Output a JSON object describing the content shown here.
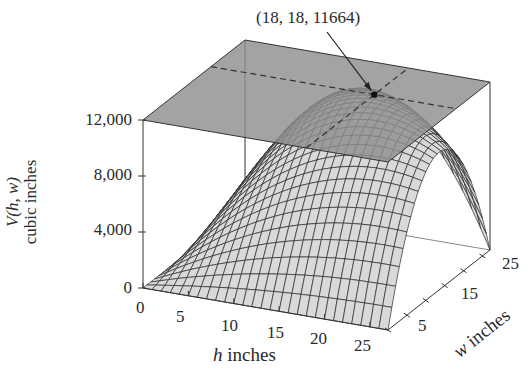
{
  "chart_data": {
    "type": "surface3d",
    "title": "",
    "function": "V(h, w) = h * w * (108 - 2h - 2w)  (volume surface), capped by plane V = 12,000",
    "annotation": {
      "text": "(18, 18, 11664)",
      "point": [
        18,
        18,
        11664
      ]
    },
    "plane": {
      "z": 12000,
      "color": "#8f8f8f"
    },
    "xaxis": {
      "label_var": "h",
      "label_unit": " inches",
      "ticks": [
        0,
        5,
        10,
        15,
        20,
        25
      ],
      "range": [
        0,
        27
      ]
    },
    "yaxis": {
      "label_var": "w",
      "label_unit": " inches",
      "ticks": [
        5,
        15,
        25
      ],
      "range": [
        0,
        27
      ]
    },
    "zaxis": {
      "label_line1_var": "V(h, w)",
      "label_line2": "cubic inches",
      "ticks": [
        0,
        4000,
        8000,
        12000
      ],
      "tick_labels": [
        "0",
        "4,000",
        "8,000",
        "12,000"
      ],
      "range": [
        0,
        12000
      ]
    },
    "grid_resolution": 27,
    "colors": {
      "surface": "#d9d9d9",
      "mesh": "#2b2b2b",
      "plane": "#8f8f8f",
      "box": "#333333",
      "dashes": "#333333"
    }
  },
  "labels": {
    "annotation": "(18, 18, 11664)",
    "z_ticks": [
      "12,000",
      "8,000",
      "4,000",
      "0"
    ],
    "h_ticks": [
      "0",
      "5",
      "10",
      "15",
      "20",
      "25"
    ],
    "w_ticks": [
      "5",
      "15",
      "25"
    ],
    "z_title_1": "V(h, w)",
    "z_title_2": "cubic inches",
    "h_title_var": "h",
    "h_title_unit": " inches",
    "w_title_var": "w",
    "w_title_unit": " inches"
  }
}
